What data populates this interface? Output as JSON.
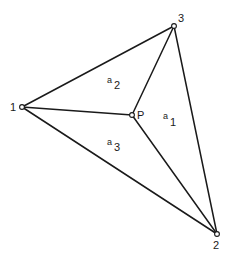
{
  "diagram": {
    "vertices": [
      {
        "id": "1",
        "label": "1",
        "x": 22,
        "y": 107,
        "label_x": 12,
        "label_y": 111
      },
      {
        "id": "2",
        "label": "2",
        "x": 217,
        "y": 234,
        "label_x": 214,
        "label_y": 248
      },
      {
        "id": "3",
        "label": "3",
        "x": 174,
        "y": 26,
        "label_x": 178,
        "label_y": 22
      }
    ],
    "interior_point": {
      "id": "P",
      "label": "P",
      "x": 132,
      "y": 115,
      "label_x": 137,
      "label_y": 118
    },
    "regions": [
      {
        "id": "a1",
        "letter": "a",
        "subscript": "1",
        "x": 164,
        "y": 120
      },
      {
        "id": "a2",
        "letter": "a",
        "subscript": "2",
        "x": 108,
        "y": 84
      },
      {
        "id": "a3",
        "letter": "a",
        "subscript": "3",
        "x": 108,
        "y": 146
      }
    ],
    "colors": {
      "stroke": "#1a1a1a",
      "background": "#ffffff"
    }
  }
}
